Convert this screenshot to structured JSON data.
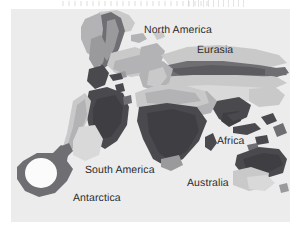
{
  "figure": {
    "kind": "world-map-figure",
    "background_color": "#ffffff",
    "panel_color": "#ececed",
    "panel": {
      "x": 11,
      "y": 9,
      "width": 279,
      "height": 213
    },
    "scan_artifact": true
  },
  "map": {
    "title": "",
    "projection": "stylized world outline",
    "ocean_color": "#ececed",
    "label_color": "#2c2c2e",
    "labels": [
      {
        "id": "north-america",
        "text": "North America",
        "x": 133,
        "y": 15
      },
      {
        "id": "eurasia",
        "text": "Eurasia",
        "x": 186,
        "y": 35
      },
      {
        "id": "africa",
        "text": "Africa",
        "x": 206,
        "y": 126
      },
      {
        "id": "south-america",
        "text": "South America",
        "x": 74,
        "y": 155
      },
      {
        "id": "australia",
        "text": "Australia",
        "x": 176,
        "y": 168
      },
      {
        "id": "antarctica",
        "text": "Antarctica",
        "x": 62,
        "y": 183
      }
    ],
    "shades": {
      "lightest": "#d9d9da",
      "light": "#c9c9ca",
      "medium": "#b3b3b5",
      "mid_dark": "#9a9a9d",
      "dark": "#6f6f73",
      "darkest": "#4a4a4e",
      "hole": "#fbfbfb"
    },
    "shade_legend_order": [
      "lightest",
      "light",
      "medium",
      "mid_dark",
      "dark",
      "darkest"
    ]
  }
}
